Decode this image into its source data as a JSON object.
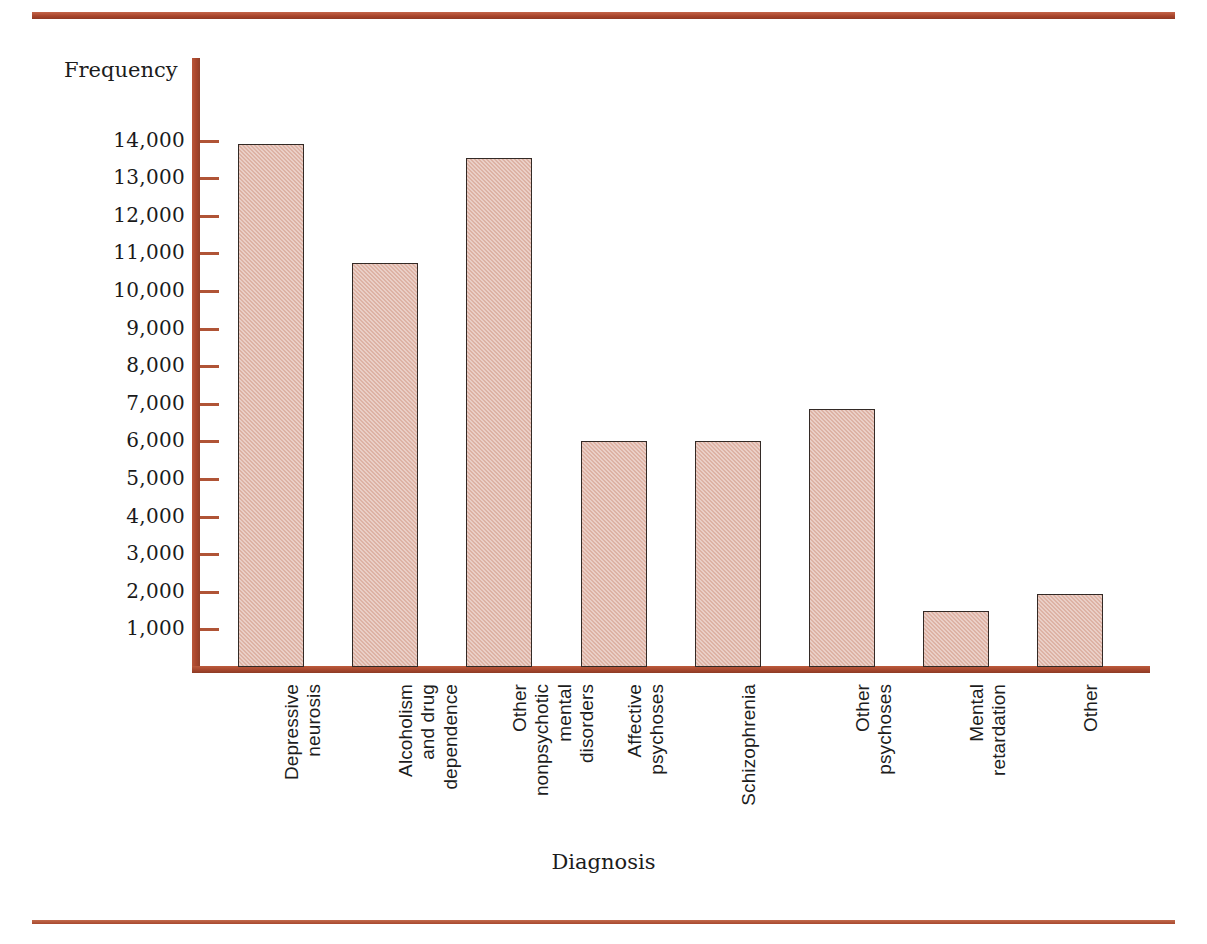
{
  "chart_data": {
    "type": "bar",
    "title": "",
    "xlabel": "Diagnosis",
    "ylabel": "Frequency",
    "ylim": [
      0,
      14500
    ],
    "grid": false,
    "legend": null,
    "categories": [
      "Depressive neurosis",
      "Alcoholism and drug dependence",
      "Other nonpsychotic mental disorders",
      "Affective psychoses",
      "Schizophrenia",
      "Other psychoses",
      "Mental retardation",
      "Other"
    ],
    "category_lines": [
      "Depressive\nneurosis",
      "Alcoholism\nand drug\ndependence",
      "Other\nnonpsychotic\nmental\ndisorders",
      "Affective\npsychoses",
      "Schizophrenia",
      "Other\npsychoses",
      "Mental\nretardation",
      "Other"
    ],
    "values": [
      13900,
      10750,
      13550,
      6000,
      6000,
      6850,
      1500,
      1950
    ],
    "ytick_labels": [
      "14,000",
      "13,000",
      "12,000",
      "11,000",
      "10,000",
      "9,000",
      "8,000",
      "7,000",
      "6,000",
      "5,000",
      "4,000",
      "3,000",
      "2,000",
      "1,000"
    ],
    "ytick_values": [
      14000,
      13000,
      12000,
      11000,
      10000,
      9000,
      8000,
      7000,
      6000,
      5000,
      4000,
      3000,
      2000,
      1000
    ],
    "colors": {
      "bar_fill": "#ddb2a4",
      "bar_border": "#332a26",
      "axis": "#a9462c",
      "rule": "#a9452c",
      "text": "#1a1a1a",
      "background": "#ffffff"
    }
  }
}
